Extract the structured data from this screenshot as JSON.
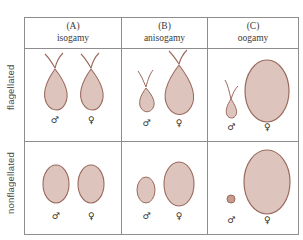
{
  "figure": {
    "row_labels": [
      {
        "key": "flagellated",
        "text": "flagellated"
      },
      {
        "key": "nonflagellated",
        "text": "nonflagellated"
      }
    ],
    "columns": [
      {
        "tag": "(A)",
        "name": "isogamy"
      },
      {
        "tag": "(B)",
        "name": "anisogamy"
      },
      {
        "tag": "(C)",
        "name": "oogamy"
      }
    ],
    "symbols": {
      "male": "♂",
      "female": "♀"
    },
    "colors": {
      "gamete_fill": "#ddc5bd",
      "gamete_stroke": "#9b6a5e",
      "flagellum": "#9b6a5e",
      "grid_line": "#8d8d8d",
      "text": "#3a3a3a",
      "background": "#ffffff"
    },
    "cells": [
      {
        "row": "flagellated",
        "column": "isogamy",
        "gametes": [
          {
            "sex": "male",
            "shape": "teardrop",
            "size": "medium",
            "flagella": 2
          },
          {
            "sex": "female",
            "shape": "teardrop",
            "size": "medium",
            "flagella": 2
          }
        ]
      },
      {
        "row": "flagellated",
        "column": "anisogamy",
        "gametes": [
          {
            "sex": "male",
            "shape": "teardrop",
            "size": "small",
            "flagella": 2
          },
          {
            "sex": "female",
            "shape": "teardrop",
            "size": "large",
            "flagella": 2
          }
        ]
      },
      {
        "row": "flagellated",
        "column": "oogamy",
        "gametes": [
          {
            "sex": "male",
            "shape": "flask",
            "size": "tiny",
            "flagella": 1
          },
          {
            "sex": "female",
            "shape": "ellipse",
            "size": "xlarge",
            "flagella": 0
          }
        ]
      },
      {
        "row": "nonflagellated",
        "column": "isogamy",
        "gametes": [
          {
            "sex": "male",
            "shape": "ellipse",
            "size": "medium",
            "flagella": 0
          },
          {
            "sex": "female",
            "shape": "ellipse",
            "size": "medium",
            "flagella": 0
          }
        ]
      },
      {
        "row": "nonflagellated",
        "column": "anisogamy",
        "gametes": [
          {
            "sex": "male",
            "shape": "ellipse",
            "size": "small",
            "flagella": 0
          },
          {
            "sex": "female",
            "shape": "ellipse",
            "size": "large",
            "flagella": 0
          }
        ]
      },
      {
        "row": "nonflagellated",
        "column": "oogamy",
        "gametes": [
          {
            "sex": "male",
            "shape": "dot",
            "size": "tiny",
            "flagella": 0
          },
          {
            "sex": "female",
            "shape": "ellipse",
            "size": "xlarge",
            "flagella": 0
          }
        ]
      }
    ]
  }
}
